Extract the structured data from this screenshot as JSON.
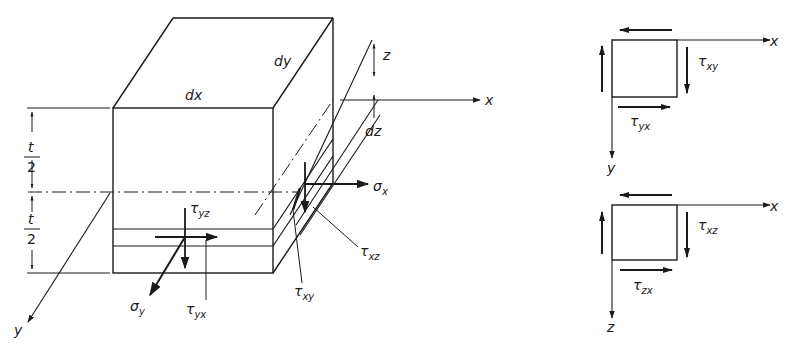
{
  "diagram": {
    "type": "mechanics-stress-element",
    "colors": {
      "ink": "#1a1a1a",
      "background": "#ffffff"
    },
    "block": {
      "dimension_labels": {
        "dx": "dx",
        "dy": "dy",
        "dz": "dz",
        "z": "z"
      },
      "thickness_labels": {
        "upper_num": "t",
        "upper_den": "2",
        "lower_num": "t",
        "lower_den": "2"
      },
      "axes": {
        "x": "x",
        "y": "y"
      },
      "stress_labels": {
        "sigma_x": {
          "base": "σ",
          "sub": "x"
        },
        "sigma_y": {
          "base": "σ",
          "sub": "y"
        },
        "tau_yz": {
          "base": "τ",
          "sub": "yz"
        },
        "tau_yx": {
          "base": "τ",
          "sub": "yx"
        },
        "tau_xy": {
          "base": "τ",
          "sub": "xy"
        },
        "tau_xz": {
          "base": "τ",
          "sub": "xz"
        }
      }
    },
    "element_xy": {
      "axes": {
        "x": "x",
        "y": "y"
      },
      "labels": {
        "tau_xy": {
          "base": "τ",
          "sub": "xy"
        },
        "tau_yx": {
          "base": "τ",
          "sub": "yx"
        }
      }
    },
    "element_xz": {
      "axes": {
        "x": "x",
        "z": "z"
      },
      "labels": {
        "tau_xz": {
          "base": "τ",
          "sub": "xz"
        },
        "tau_zx": {
          "base": "τ",
          "sub": "zx"
        }
      }
    }
  }
}
